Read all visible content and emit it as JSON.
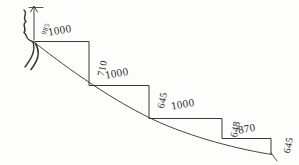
{
  "drawing": {
    "title": "stepped-profile-sketch",
    "medium": "hand-drawn pencil sketch",
    "background_color": "#fdfdfc",
    "ink_color": "#2f2f2f",
    "units_note": "millimetres (unlabelled)"
  },
  "annotations": {
    "top_marker": {
      "value": "985",
      "rotation_deg": -68
    }
  },
  "steps": [
    {
      "index": 1,
      "run_label": "1000",
      "rise_label": "710",
      "run_rotation_deg": -10,
      "rise_rotation_deg": -78
    },
    {
      "index": 2,
      "run_label": "1000",
      "rise_label": "645",
      "run_rotation_deg": -10,
      "rise_rotation_deg": -78
    },
    {
      "index": 3,
      "run_label": "1000",
      "rise_label": "648",
      "run_rotation_deg": -10,
      "rise_rotation_deg": -78
    },
    {
      "index": 4,
      "run_label": "870",
      "rise_label": "645",
      "run_rotation_deg": -10,
      "rise_rotation_deg": -78
    }
  ],
  "geometry": {
    "staircase_polyline": "M 36,41 L 89,41 L 89,85 L 149,85 L 149,118 L 222,118 L 222,138 L 271,138 L 271,154",
    "curve_path": "M 33,41 C 60,62 110,100 160,122 C 200,139 240,148 273,154",
    "top_squiggle_path": "M 24,10 C 28,14 22,18 26,22 C 21,25 27,29 24,33 C 28,36 24,39 33,42",
    "arrow_shaft_path": "M 34,7 L 34,40",
    "arrow_head_path": "M 30,11 L 34,5 L 38,11",
    "tick_top_path": "M 30,7 L 42,7",
    "left_tail_path": "M 33,42 C 36,52 30,60 25,68",
    "left_tail2_path": "M 35,43 C 40,54 36,62 30,70",
    "bottom_tick_path": "M 271,154 L 277,160"
  }
}
